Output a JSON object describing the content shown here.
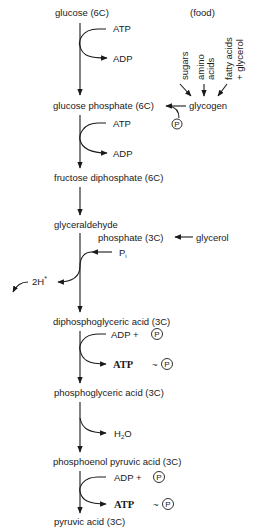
{
  "diagram": {
    "type": "metabolic-pathway",
    "pathway": "glycolysis",
    "compounds": [
      {
        "id": "glucose",
        "label": "glucose (6C)"
      },
      {
        "id": "glucose_phosphate",
        "label": "glucose phosphate (6C)"
      },
      {
        "id": "fructose_diphosphate",
        "label": "fructose diphosphate (6C)"
      },
      {
        "id": "glyceraldehyde",
        "label": "glyceraldehyde"
      },
      {
        "id": "glyceraldehyde_phosphate",
        "label": "phosphate (3C)"
      },
      {
        "id": "diphosphoglyceric_acid",
        "label": "diphosphoglyceric acid (3C)"
      },
      {
        "id": "phosphoglyceric_acid",
        "label": "phosphoglyceric acid (3C)"
      },
      {
        "id": "phosphoenol_pyruvic_acid",
        "label": "phosphoenol pyruvic acid (3C)"
      },
      {
        "id": "pyruvic_acid",
        "label": "pyruvic acid (3C)"
      }
    ],
    "food": {
      "header": "(food)",
      "sources": [
        {
          "line1": "sugars",
          "line2": ""
        },
        {
          "line1": "amino",
          "line2": "acids"
        },
        {
          "line1": "fatty acids",
          "line2": "+ glycerol"
        }
      ],
      "glycogen": "glycogen",
      "glycerol": "glycerol"
    },
    "side_labels": {
      "atp1": "ATP",
      "adp1": "ADP",
      "atp2": "ATP",
      "adp2": "ADP",
      "pi": "P",
      "pi_sub": "i",
      "hydrogen": "2H",
      "hydrogen_sup": "*",
      "adp_plus_p1": "ADP +",
      "atp3": "ATP",
      "h2o": "H",
      "h2o_sub": "2",
      "h2o_tail": "O",
      "adp_plus_p2": "ADP +",
      "atp4": "ATP",
      "tilde": "~",
      "phosphate_symbol": "P"
    }
  }
}
